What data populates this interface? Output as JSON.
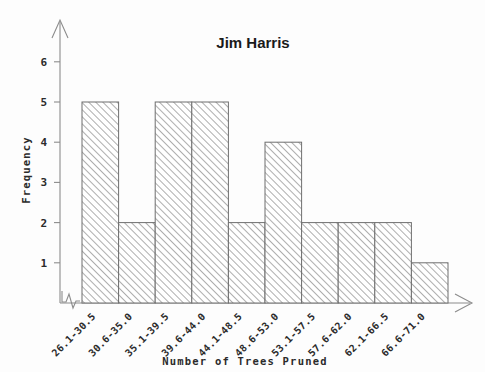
{
  "chart_data": {
    "type": "bar",
    "title": "Jim Harris",
    "xlabel": "Number of Trees Pruned",
    "ylabel": "Frequency",
    "categories": [
      "26.1-30.5",
      "30.6-35.0",
      "35.1-39.5",
      "39.6-44.0",
      "44.1-48.5",
      "48.6-53.0",
      "53.1-57.5",
      "57.6-62.0",
      "62.1-66.5",
      "66.6-71.0"
    ],
    "values": [
      5,
      2,
      5,
      5,
      2,
      4,
      2,
      2,
      2,
      1
    ],
    "ytick_labels": [
      "1",
      "2",
      "3",
      "4",
      "5",
      "6"
    ],
    "ytick_values": [
      1,
      2,
      3,
      4,
      5,
      6
    ],
    "ylim": [
      0,
      6.6
    ],
    "grid": false,
    "legend": null,
    "axis_break_x": true,
    "bar_fill": "hatched-diagonal",
    "colors": {
      "bar_outline": "#6f6f6f",
      "hatch": "#9a9a9a",
      "axis": "#8c8c8c",
      "text": "#2b2b2b",
      "title": "#1a1a1a",
      "background": "#fdfdfd"
    }
  }
}
